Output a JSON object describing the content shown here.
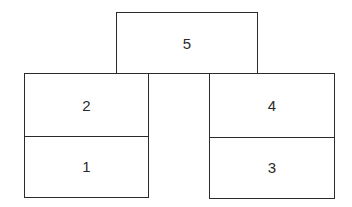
{
  "diagram": {
    "type": "stacked-blocks",
    "colors": {
      "stroke": "#2a2a2a",
      "fill": "#ffffff",
      "text": "#2a2a2a"
    },
    "top_block": {
      "label": "5"
    },
    "left_stack": {
      "upper": {
        "label": "2"
      },
      "lower": {
        "label": "1"
      }
    },
    "right_stack": {
      "upper": {
        "label": "4"
      },
      "lower": {
        "label": "3"
      }
    }
  }
}
